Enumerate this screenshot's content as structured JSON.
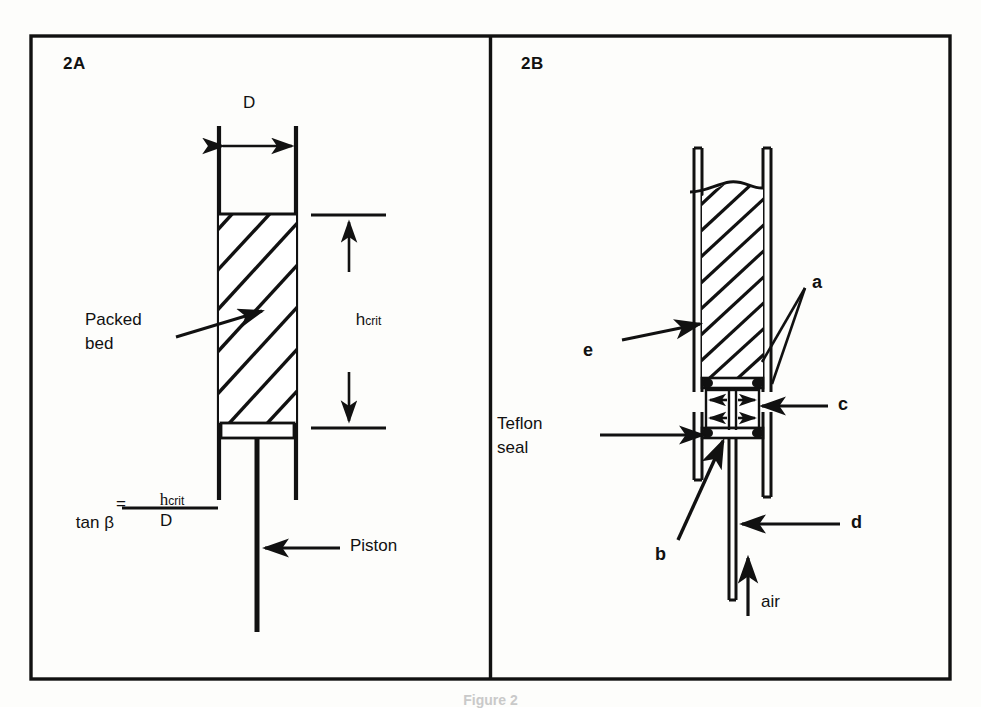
{
  "figure": {
    "caption": "Figure 2",
    "panels": [
      {
        "id": "2A",
        "labels": {
          "diameter": "D",
          "h_crit_base": "h",
          "h_crit_sub": "crit",
          "packed_bed_line1": "Packed",
          "packed_bed_line2": "bed",
          "piston": "Piston"
        },
        "equation": {
          "lhs": "tan β",
          "relation": "=",
          "numerator_base": "h",
          "numerator_sub": "crit",
          "denominator": "D"
        }
      },
      {
        "id": "2B",
        "labels": {
          "a": "a",
          "b": "b",
          "c": "c",
          "d": "d",
          "e": "e",
          "teflon_line1": "Teflon",
          "teflon_line2": "seal",
          "air": "air"
        }
      }
    ]
  },
  "style": {
    "ink": "#111111",
    "paper": "#fdfdfb",
    "caption_ink": "#c9c9c9"
  }
}
